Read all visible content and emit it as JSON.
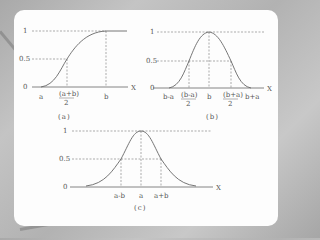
{
  "figure": {
    "panels": [
      {
        "id": "a",
        "caption": "(a)",
        "curve": "s-shaped membership function",
        "y_ticks": [
          "1",
          "0.5",
          "0"
        ],
        "x_axis_label": "X",
        "x_ticks": [
          "a",
          "(a+b)",
          "2",
          "b"
        ]
      },
      {
        "id": "b",
        "caption": "(b)",
        "curve": "pi-shaped membership function",
        "y_ticks": [
          "1",
          "0.5",
          "0"
        ],
        "x_axis_label": "X",
        "x_ticks": [
          "b-a",
          "(b-a)",
          "2",
          "b",
          "(b+a)",
          "2",
          "b+a"
        ]
      },
      {
        "id": "c",
        "caption": "(c)",
        "curve": "bell-shaped membership function",
        "y_ticks": [
          "1",
          "0.5",
          "0"
        ],
        "x_axis_label": "X",
        "x_ticks": [
          "a-b",
          "a",
          "a+b"
        ]
      }
    ]
  },
  "colors": {
    "curve": "#666666",
    "dashed": "#777777",
    "card": "#fdfdfd",
    "background": "#b5b5b5"
  }
}
